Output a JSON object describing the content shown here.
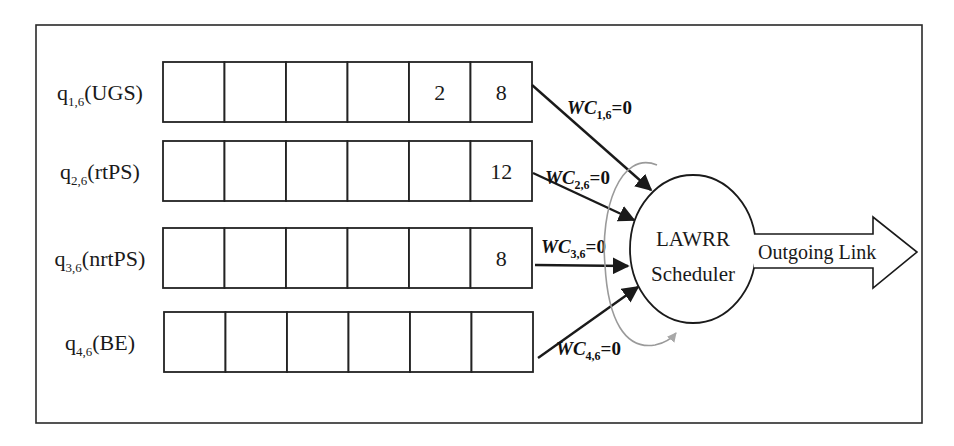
{
  "diagram": {
    "queues": [
      {
        "name": "q",
        "sub": "1,6",
        "class": "(UGS)",
        "cells": [
          "",
          "",
          "",
          "",
          "2",
          "8"
        ],
        "weight_label": "WC",
        "weight_sub": "1,6",
        "weight_value": "=0"
      },
      {
        "name": "q",
        "sub": "2,6",
        "class": "(rtPS)",
        "cells": [
          "",
          "",
          "",
          "",
          "",
          "12"
        ],
        "weight_label": "WC",
        "weight_sub": "2,6",
        "weight_value": "=0"
      },
      {
        "name": "q",
        "sub": "3,6",
        "class": "(nrtPS)",
        "cells": [
          "",
          "",
          "",
          "",
          "",
          "8"
        ],
        "weight_label": "WC",
        "weight_sub": "3,6",
        "weight_value": "=0"
      },
      {
        "name": "q",
        "sub": "4,6",
        "class": "(BE)",
        "cells": [
          "",
          "",
          "",
          "",
          "",
          ""
        ],
        "weight_label": "WC",
        "weight_sub": "4,6",
        "weight_value": "=0"
      }
    ],
    "scheduler": {
      "line1": "LAWRR",
      "line2": "Scheduler"
    },
    "output": {
      "label": "Outgoing Link"
    },
    "colors": {
      "stroke": "#1a1a1a",
      "round_robin_arc": "#9a9a9a",
      "background": "#ffffff"
    }
  }
}
